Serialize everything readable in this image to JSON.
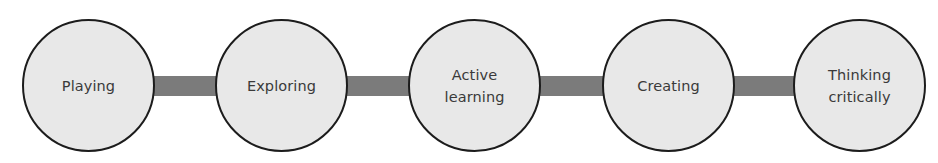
{
  "diagram": {
    "type": "linear-process-chain",
    "nodes": [
      {
        "id": "playing",
        "label": "Playing"
      },
      {
        "id": "exploring",
        "label": "Exploring"
      },
      {
        "id": "active-learning",
        "label": "Active\nlearning"
      },
      {
        "id": "creating",
        "label": "Creating"
      },
      {
        "id": "thinking-critically",
        "label": "Thinking\ncritically"
      }
    ],
    "edges": [
      {
        "from": "playing",
        "to": "exploring"
      },
      {
        "from": "exploring",
        "to": "active-learning"
      },
      {
        "from": "active-learning",
        "to": "creating"
      },
      {
        "from": "creating",
        "to": "thinking-critically"
      }
    ],
    "colors": {
      "node_fill": "#e8e8e8",
      "node_border": "#1c1c1c",
      "connector": "#7b7b7b",
      "text": "#3a3a3a",
      "background": "#ffffff"
    }
  }
}
